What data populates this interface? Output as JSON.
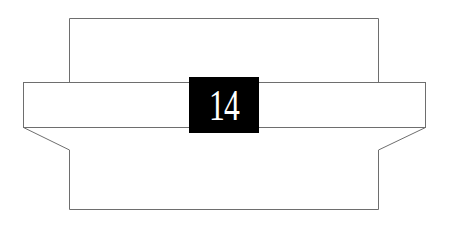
{
  "diagram": {
    "label": "14",
    "colors": {
      "line": "#6e6e6e",
      "box": "#000000",
      "label": "#ffffff",
      "background": "#ffffff"
    }
  }
}
